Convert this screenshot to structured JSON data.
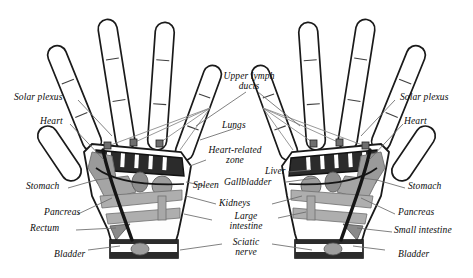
{
  "figure": {
    "background_color": "#ffffff",
    "ink_color": "#111111",
    "palette": {
      "outline": "#1a1a1a",
      "dark_zone": "#2b2b2b",
      "mid_gray": "#8f8f8f",
      "light_gray": "#b9b9b9",
      "pale_gray": "#d4d4d4",
      "leader_line": "#5a5a5a"
    }
  },
  "labels": {
    "left": [
      {
        "id": "solar-plexus",
        "text": "Solar plexus"
      },
      {
        "id": "heart",
        "text": "Heart"
      },
      {
        "id": "stomach",
        "text": "Stomach"
      },
      {
        "id": "pancreas",
        "text": "Pancreas"
      },
      {
        "id": "rectum",
        "text": "Rectum"
      },
      {
        "id": "bladder",
        "text": "Bladder"
      }
    ],
    "right": [
      {
        "id": "solar-plexus",
        "text": "Solar plexus"
      },
      {
        "id": "heart",
        "text": "Heart"
      },
      {
        "id": "stomach",
        "text": "Stomach"
      },
      {
        "id": "pancreas",
        "text": "Pancreas"
      },
      {
        "id": "small-intestine",
        "text": "Small intestine"
      },
      {
        "id": "bladder",
        "text": "Bladder"
      }
    ],
    "center": [
      {
        "id": "upper-lymph-ducts",
        "line1": "Upper lymph",
        "line2": "ducts"
      },
      {
        "id": "lungs",
        "text": "Lungs"
      },
      {
        "id": "heart-related-zone",
        "line1": "Heart-related",
        "line2": "zone"
      },
      {
        "id": "spleen",
        "text": "Spleen"
      },
      {
        "id": "liver",
        "text": "Liver"
      },
      {
        "id": "gallbladder",
        "text": "Gallbladder"
      },
      {
        "id": "kidneys",
        "text": "Kidneys"
      },
      {
        "id": "large-intestine",
        "line1": "Large",
        "line2": "intestine"
      },
      {
        "id": "sciatic-nerve",
        "line1": "Sciatic",
        "line2": "nerve"
      }
    ]
  }
}
